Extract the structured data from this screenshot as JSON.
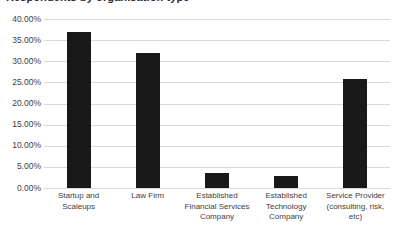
{
  "chart_data": {
    "type": "bar",
    "title": "Respondents by organisation type",
    "title_truncated": true,
    "xlabel": "",
    "ylabel": "",
    "categories": [
      "Startup and Scaleups",
      "Law Firm",
      "Established Financial Services Company",
      "Established Technology Company",
      "Service Provider (consulting, risk, etc)"
    ],
    "values": [
      37.0,
      32.0,
      3.5,
      2.8,
      25.7
    ],
    "ylim": [
      0,
      40
    ],
    "ytick_labels": [
      "40.00%",
      "35.00%",
      "30.00%",
      "25.00%",
      "20.00%",
      "15.00%",
      "10.00%",
      "5.00%",
      "0.00%"
    ],
    "ytick_values": [
      40,
      35,
      30,
      25,
      20,
      15,
      10,
      5,
      0
    ],
    "grid": true,
    "legend": false,
    "bar_color": "#191919",
    "gridline_color": "#d9d9d9",
    "background_color": "#ffffff"
  }
}
